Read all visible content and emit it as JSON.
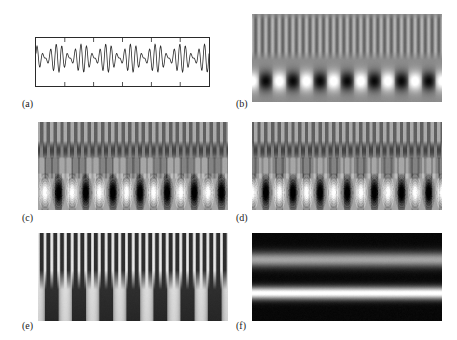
{
  "figure": {
    "background": "#ffffff",
    "width": 457,
    "height": 340,
    "type": "multi-panel-scientific-figure"
  },
  "panels": [
    {
      "id": "a",
      "label": "(a)",
      "kind": "line-plot",
      "label_x": 22,
      "label_y": 98,
      "frame": {
        "x": 35,
        "y": 37,
        "width": 175,
        "height": 50
      },
      "frame_color": "#2a2a2a",
      "line_color": "#2b2b2b",
      "ticks": {
        "top_count": 5,
        "bottom_count": 5,
        "length": 4
      }
    },
    {
      "id": "b",
      "label": "(b)",
      "kind": "raster-gray",
      "label_x": 236,
      "label_y": 98,
      "frame": {
        "x": 252,
        "y": 14,
        "width": 190,
        "height": 88
      },
      "render": "stripes-top-blobs-bottom"
    },
    {
      "id": "c",
      "label": "(c)",
      "kind": "raster-gray",
      "label_x": 22,
      "label_y": 212,
      "frame": {
        "x": 38,
        "y": 122,
        "width": 190,
        "height": 88
      },
      "render": "contour-rings-segmented"
    },
    {
      "id": "d",
      "label": "(d)",
      "kind": "raster-gray",
      "label_x": 236,
      "label_y": 212,
      "frame": {
        "x": 252,
        "y": 122,
        "width": 190,
        "height": 88
      },
      "render": "contour-rings-segmented-offset"
    },
    {
      "id": "e",
      "label": "(e)",
      "kind": "raster-gray",
      "label_x": 22,
      "label_y": 320,
      "frame": {
        "x": 38,
        "y": 233,
        "width": 190,
        "height": 88
      },
      "render": "merging-columns-scalogram"
    },
    {
      "id": "f",
      "label": "(f)",
      "kind": "raster-gray",
      "label_x": 236,
      "label_y": 320,
      "frame": {
        "x": 252,
        "y": 233,
        "width": 190,
        "height": 88
      },
      "render": "horizontal-bands"
    }
  ],
  "chart_data": {
    "type": "line",
    "title": "",
    "xlabel": "",
    "ylabel": "",
    "grid": false,
    "legend": null,
    "xlim": [
      0,
      1
    ],
    "ylim": [
      -1.25,
      1.25
    ],
    "series": [
      {
        "name": "amplitude-modulated-signal",
        "description": "Sum of two close-frequency sinusoids producing a beating / amplitude-modulated waveform with roughly 28 fast oscillations and 7 beat envelopes across the window",
        "carrier_cycles": 28,
        "beat_cycles": 7,
        "amplitude_fast": 0.55,
        "amplitude_slow": 0.45
      }
    ]
  },
  "raster_params": {
    "b": {
      "bg_level": 0.55,
      "stripe_band": {
        "y0": 0.06,
        "y1": 0.42,
        "cycles": 28,
        "contrast": 0.18
      },
      "blob_band": {
        "y_center": 0.76,
        "cycles": 7,
        "contrast": 1.0
      }
    },
    "c": {
      "phase": 0.0,
      "stripe_cycles": 28,
      "blob_cycles": 7,
      "levels": 6
    },
    "d": {
      "phase": 0.5,
      "stripe_cycles": 28,
      "blob_cycles": 7,
      "levels": 6
    },
    "e": {
      "stripe_cycles": 28,
      "column_cycles": 7,
      "merge_y": 0.42
    },
    "f": {
      "bands": [
        {
          "center": 0.3,
          "width": 0.11,
          "intensity": 0.62
        },
        {
          "center": 0.68,
          "width": 0.09,
          "intensity": 1.0
        }
      ],
      "bg_level": 0.03
    }
  }
}
